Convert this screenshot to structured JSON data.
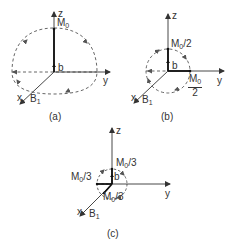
{
  "figure": {
    "panels": [
      {
        "id": "a",
        "caption": "(a)",
        "axes": {
          "z": "z",
          "y": "y",
          "x": "x"
        },
        "field_label": "B",
        "field_sub": "1",
        "moment_label": "M",
        "moment_sub": "0",
        "moment_suffix": "",
        "b_label": "b"
      },
      {
        "id": "b",
        "caption": "(b)",
        "axes": {
          "z": "z",
          "y": "y",
          "x": "x"
        },
        "field_label": "B",
        "field_sub": "1",
        "moment_label": "M",
        "moment_sub": "0",
        "moment_suffix": "/2",
        "y_component_num_main": "M",
        "y_component_num_sub": "0",
        "y_component_den": "2",
        "b_label": "b"
      },
      {
        "id": "c",
        "caption": "(c)",
        "axes": {
          "z": "z",
          "y": "y",
          "x": "x"
        },
        "field_label": "B",
        "field_sub": "1",
        "moment_label": "M",
        "moment_sub": "0",
        "moment_suffix": "/3",
        "left_label_main": "M",
        "left_label_sub": "0",
        "left_label_suffix": "/3",
        "bottom_label_main": "M",
        "bottom_label_sub": "0",
        "bottom_label_suffix": "/3",
        "b_label": "b"
      }
    ]
  }
}
